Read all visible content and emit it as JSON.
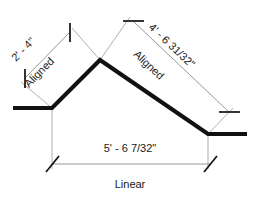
{
  "diagram": {
    "background_color": "#ffffff",
    "geometry_color": "#111111",
    "dimension_line_color": "#8c8c8c",
    "text_color": "#1a1a1a"
  },
  "dimensions": {
    "left_aligned": {
      "value": "2' - 4\"",
      "type_label": "Aligned"
    },
    "right_aligned": {
      "value": "4' - 6 31/32\"",
      "type_label": "Aligned"
    },
    "bottom_linear": {
      "value": "5' - 6 7/32\"",
      "type_label": "Linear"
    }
  }
}
